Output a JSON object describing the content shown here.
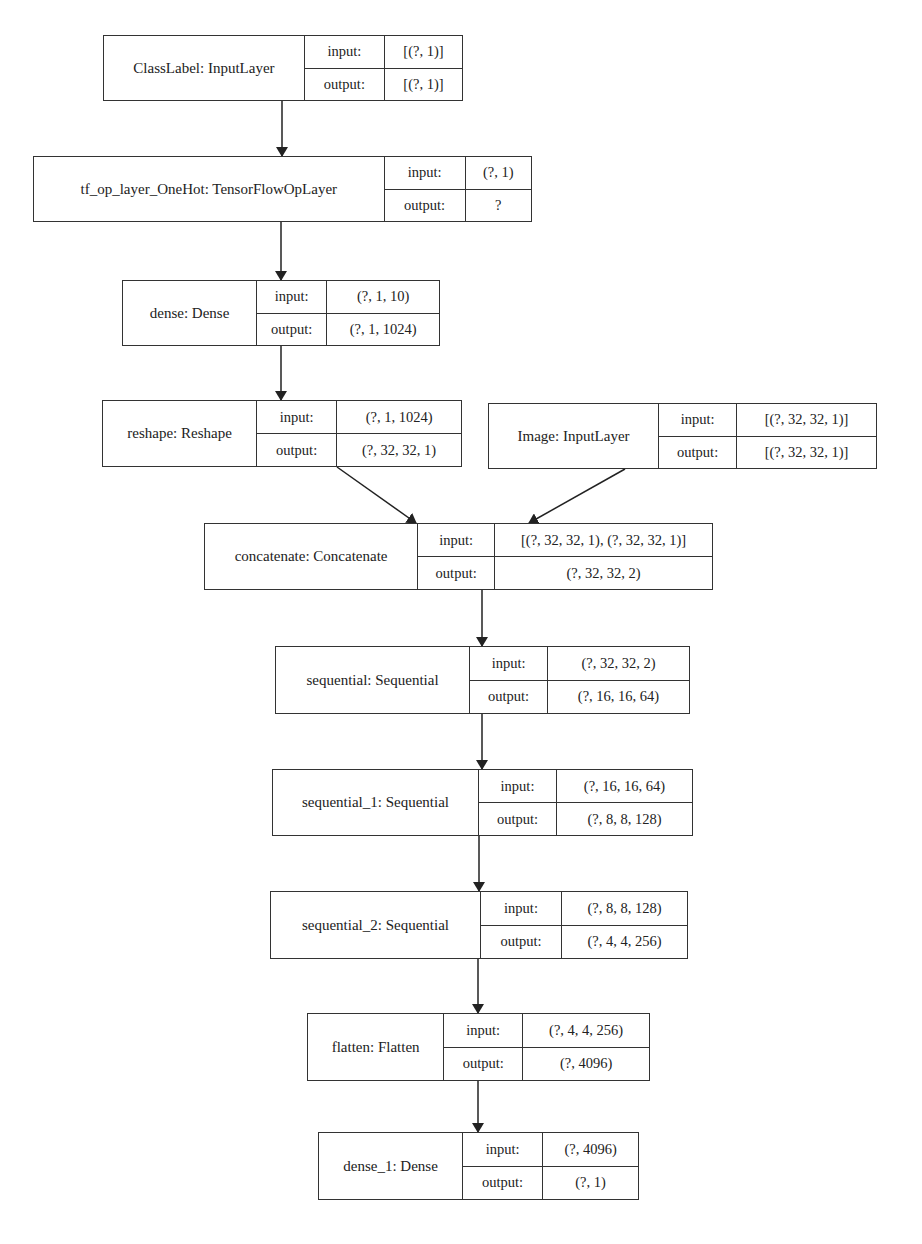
{
  "diagram": {
    "colors": {
      "border": "#333333",
      "text": "#222222",
      "background": "#ffffff"
    },
    "io_labels": {
      "input": "input:",
      "output": "output:"
    },
    "nodes": [
      {
        "id": "classlabel",
        "label": "ClassLabel: InputLayer",
        "input": "[(?, 1)]",
        "output": "[(?, 1)]",
        "x": 103,
        "y": 35,
        "w": 360,
        "h": 66,
        "nameW": 202,
        "keyW": 80
      },
      {
        "id": "onehot",
        "label": "tf_op_layer_OneHot: TensorFlowOpLayer",
        "input": "(?, 1)",
        "output": "?",
        "x": 33,
        "y": 156,
        "w": 499,
        "h": 66,
        "nameW": 352,
        "keyW": 81
      },
      {
        "id": "dense",
        "label": "dense: Dense",
        "input": "(?, 1, 10)",
        "output": "(?, 1, 1024)",
        "x": 122,
        "y": 280,
        "w": 318,
        "h": 66,
        "nameW": 135,
        "keyW": 70
      },
      {
        "id": "reshape",
        "label": "reshape: Reshape",
        "input": "(?, 1, 1024)",
        "output": "(?, 32, 32, 1)",
        "x": 102,
        "y": 400,
        "w": 360,
        "h": 67,
        "nameW": 155,
        "keyW": 80
      },
      {
        "id": "image",
        "label": "Image: InputLayer",
        "input": "[(?, 32, 32, 1)]",
        "output": "[(?, 32, 32, 1)]",
        "x": 488,
        "y": 403,
        "w": 389,
        "h": 66,
        "nameW": 171,
        "keyW": 78
      },
      {
        "id": "concatenate",
        "label": "concatenate: Concatenate",
        "input": "[(?, 32, 32, 1), (?, 32, 32, 1)]",
        "output": "(?, 32, 32, 2)",
        "x": 204,
        "y": 523,
        "w": 509,
        "h": 67,
        "nameW": 214,
        "keyW": 77
      },
      {
        "id": "sequential",
        "label": "sequential: Sequential",
        "input": "(?, 32, 32, 2)",
        "output": "(?, 16, 16, 64)",
        "x": 275,
        "y": 646,
        "w": 415,
        "h": 68,
        "nameW": 195,
        "keyW": 78
      },
      {
        "id": "sequential_1",
        "label": "sequential_1: Sequential",
        "input": "(?, 16, 16, 64)",
        "output": "(?, 8, 8, 128)",
        "x": 272,
        "y": 769,
        "w": 421,
        "h": 67,
        "nameW": 207,
        "keyW": 78
      },
      {
        "id": "sequential_2",
        "label": "sequential_2: Sequential",
        "input": "(?, 8, 8, 128)",
        "output": "(?, 4, 4, 256)",
        "x": 270,
        "y": 891,
        "w": 418,
        "h": 68,
        "nameW": 211,
        "keyW": 81
      },
      {
        "id": "flatten",
        "label": "flatten: Flatten",
        "input": "(?, 4, 4, 256)",
        "output": "(?, 4096)",
        "x": 307,
        "y": 1013,
        "w": 343,
        "h": 68,
        "nameW": 137,
        "keyW": 79
      },
      {
        "id": "dense_1",
        "label": "dense_1: Dense",
        "input": "(?, 4096)",
        "output": "(?, 1)",
        "x": 318,
        "y": 1132,
        "w": 321,
        "h": 68,
        "nameW": 145,
        "keyW": 80
      }
    ],
    "edges": [
      {
        "from": "classlabel",
        "to": "onehot",
        "x1": 282,
        "y1": 101,
        "x2": 282,
        "y2": 156
      },
      {
        "from": "onehot",
        "to": "dense",
        "x1": 281,
        "y1": 222,
        "x2": 281,
        "y2": 280
      },
      {
        "from": "dense",
        "to": "reshape",
        "x1": 281,
        "y1": 346,
        "x2": 281,
        "y2": 400
      },
      {
        "from": "reshape",
        "to": "concatenate",
        "x1": 337,
        "y1": 467,
        "x2": 416,
        "y2": 523
      },
      {
        "from": "image",
        "to": "concatenate",
        "x1": 625,
        "y1": 469,
        "x2": 529,
        "y2": 523
      },
      {
        "from": "concatenate",
        "to": "sequential",
        "x1": 482,
        "y1": 590,
        "x2": 482,
        "y2": 646
      },
      {
        "from": "sequential",
        "to": "sequential_1",
        "x1": 482,
        "y1": 714,
        "x2": 482,
        "y2": 769
      },
      {
        "from": "sequential_1",
        "to": "sequential_2",
        "x1": 479,
        "y1": 836,
        "x2": 479,
        "y2": 891
      },
      {
        "from": "sequential_2",
        "to": "flatten",
        "x1": 478,
        "y1": 959,
        "x2": 478,
        "y2": 1013
      },
      {
        "from": "flatten",
        "to": "dense_1",
        "x1": 478,
        "y1": 1081,
        "x2": 478,
        "y2": 1132
      }
    ]
  }
}
